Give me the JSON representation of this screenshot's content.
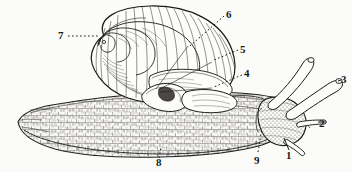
{
  "figure": {
    "background_color": "#fbfbf9",
    "ink_color": "#1a1a1a",
    "width": 352,
    "height": 172
  },
  "labels": [
    {
      "id": "1",
      "text": "1",
      "x": 286,
      "y": 150,
      "part": "lower-tentacle-right",
      "leader": "line"
    },
    {
      "id": "2",
      "text": "2",
      "x": 319,
      "y": 118,
      "part": "lower-tentacle-left",
      "leader": "line"
    },
    {
      "id": "3",
      "text": "3",
      "x": 341,
      "y": 74,
      "part": "upper-tentacle-eye-stalk",
      "leader": "line"
    },
    {
      "id": "4",
      "text": "4",
      "x": 244,
      "y": 68,
      "part": "mantle-collar",
      "leader": "dotted"
    },
    {
      "id": "5",
      "text": "5",
      "x": 240,
      "y": 44,
      "part": "shell-aperture-lip",
      "leader": "dotted"
    },
    {
      "id": "6",
      "text": "6",
      "x": 226,
      "y": 9,
      "part": "shell-body-whorl",
      "leader": "dotted"
    },
    {
      "id": "7",
      "text": "7",
      "x": 58,
      "y": 30,
      "part": "shell-apex-spire",
      "leader": "dotted"
    },
    {
      "id": "8",
      "text": "8",
      "x": 156,
      "y": 157,
      "part": "foot-sole-margin",
      "leader": "dotted"
    },
    {
      "id": "9",
      "text": "9",
      "x": 254,
      "y": 155,
      "part": "pneumostome-respiratory-pore",
      "leader": "dotted"
    }
  ],
  "parts": {
    "shell": "coiled dextral shell with growth striae",
    "foot": "broad granular creeping foot",
    "head": "head bearing two pairs of tentacles",
    "tentacles_upper": 2,
    "tentacles_lower": 2
  }
}
